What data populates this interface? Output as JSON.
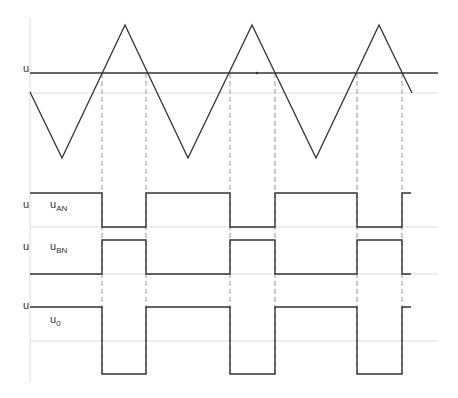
{
  "colors": {
    "waveform": "#333333",
    "axis": "#dcdcdc",
    "gridline": "#dddddd",
    "dashed": "#999999",
    "background": "#ffffff"
  },
  "carrier": {
    "name": "triangle-carrier",
    "points": [
      [
        30,
        92
      ],
      [
        62,
        158
      ],
      [
        125,
        25
      ],
      [
        188,
        158
      ],
      [
        252,
        25
      ],
      [
        316,
        158
      ],
      [
        379,
        25
      ],
      [
        412,
        93
      ]
    ]
  },
  "reference": {
    "label": "u",
    "y": 73,
    "x_start": 30,
    "x_end": 438
  },
  "gridlines_y": [
    93,
    227,
    274,
    341
  ],
  "crossings_x": [
    102,
    146,
    230,
    275,
    357,
    402
  ],
  "traces": [
    {
      "name": "u-an-trace",
      "axis_label": "u",
      "label_main": "u",
      "label_sub": "AN",
      "high_y": 193,
      "low_y": 227,
      "label_x": 50,
      "label_y": 203,
      "axis_label_y": 203,
      "points": [
        [
          30,
          193
        ],
        [
          102,
          193
        ],
        [
          102,
          227
        ],
        [
          146,
          227
        ],
        [
          146,
          193
        ],
        [
          230,
          193
        ],
        [
          230,
          227
        ],
        [
          275,
          227
        ],
        [
          275,
          193
        ],
        [
          357,
          193
        ],
        [
          357,
          227
        ],
        [
          402,
          227
        ],
        [
          402,
          193
        ],
        [
          411,
          193
        ]
      ]
    },
    {
      "name": "u-bn-trace",
      "axis_label": "u",
      "label_main": "u",
      "label_sub": "BN",
      "high_y": 240,
      "low_y": 274,
      "label_x": 50,
      "label_y": 244,
      "axis_label_y": 244,
      "points": [
        [
          30,
          274
        ],
        [
          102,
          274
        ],
        [
          102,
          240
        ],
        [
          146,
          240
        ],
        [
          146,
          274
        ],
        [
          230,
          274
        ],
        [
          230,
          240
        ],
        [
          275,
          240
        ],
        [
          275,
          274
        ],
        [
          357,
          274
        ],
        [
          357,
          240
        ],
        [
          402,
          240
        ],
        [
          402,
          274
        ],
        [
          411,
          274
        ]
      ]
    },
    {
      "name": "u0-trace",
      "axis_label": "u",
      "label_main": "u",
      "label_sub": "0",
      "high_y": 307,
      "low_y": 374,
      "label_x": 50,
      "label_y": 318,
      "axis_label_y": 300,
      "points": [
        [
          30,
          307
        ],
        [
          102,
          307
        ],
        [
          102,
          374
        ],
        [
          146,
          374
        ],
        [
          146,
          307
        ],
        [
          230,
          307
        ],
        [
          230,
          374
        ],
        [
          275,
          374
        ],
        [
          275,
          307
        ],
        [
          357,
          307
        ],
        [
          357,
          374
        ],
        [
          402,
          374
        ],
        [
          402,
          307
        ],
        [
          411,
          307
        ]
      ]
    }
  ],
  "axis": {
    "x": 30,
    "y_top": 18,
    "y_bottom": 382
  },
  "dashed_range": {
    "y_top": 73,
    "y_bottom": 374
  }
}
